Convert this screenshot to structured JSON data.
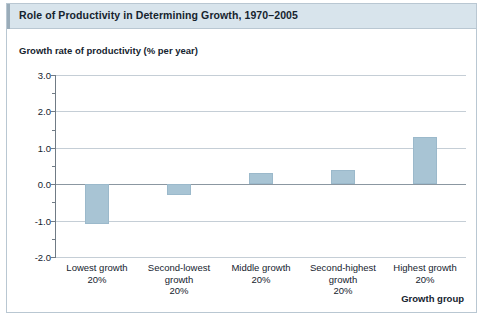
{
  "figure": {
    "caption": "Role of Productivity in Determining Growth, 1970–2005",
    "frame_color": "#b9c7d2",
    "caption_bar_color": "#d8e4ec",
    "bar_color": "#a8c4d4"
  },
  "chart_data": {
    "type": "bar",
    "title": "Role of Productivity in Determining Growth, 1970–2005",
    "subtitle": "",
    "ylabel": "Growth rate of productivity (% per year)",
    "xlabel": "Growth group",
    "categories": [
      "Lowest growth\n20%",
      "Second-lowest growth\n20%",
      "Middle growth\n20%",
      "Second-highest growth\n20%",
      "Highest growth\n20%"
    ],
    "category_lines": [
      [
        "Lowest growth",
        "20%"
      ],
      [
        "Second-lowest",
        "growth",
        "20%"
      ],
      [
        "Middle growth",
        "20%"
      ],
      [
        "Second-highest",
        "growth",
        "20%"
      ],
      [
        "Highest growth",
        "20%"
      ]
    ],
    "values": [
      -1.1,
      -0.3,
      0.3,
      0.4,
      1.3
    ],
    "ylim": [
      -2.0,
      3.0
    ],
    "ytick_labels": [
      "3.0",
      "2.0",
      "1.0",
      "0.0",
      "-1.0",
      "-2.0"
    ],
    "ytick_values": [
      3.0,
      2.0,
      1.0,
      0.0,
      -1.0,
      -2.0
    ],
    "yminor_values": [
      2.5,
      1.5,
      0.5,
      -0.5,
      -1.5
    ],
    "ystep": 1.0,
    "grid": true,
    "legend": "none",
    "zero_line": 0.0
  }
}
